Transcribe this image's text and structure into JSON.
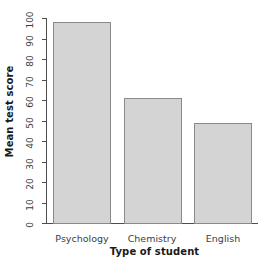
{
  "chart_data": {
    "type": "bar",
    "title": "",
    "subtitle": "",
    "xlabel": "Type of student",
    "ylabel": "Mean test score",
    "categories": [
      "Psychology",
      "Chemistry",
      "English"
    ],
    "values": [
      98,
      61,
      49
    ],
    "ylim": [
      0,
      100
    ],
    "yticks": [
      0,
      10,
      20,
      30,
      40,
      50,
      60,
      70,
      80,
      90,
      100
    ],
    "ytick_labels": [
      "0",
      "10",
      "20",
      "30",
      "40",
      "50",
      "60",
      "70",
      "80",
      "90",
      "100"
    ],
    "grid": false,
    "legend": null,
    "legend_position": "none",
    "series": [
      {
        "name": "Mean test score",
        "values": [
          98,
          61,
          49
        ]
      }
    ],
    "annotations": [],
    "colors": {
      "bar_fill": "#d4d4d4",
      "bar_border": "#8a8a8a",
      "axis": "#4d4d4d",
      "tick_label": "#3d3d3d",
      "axis_title": "#1a1a1a",
      "background": "#ffffff"
    }
  }
}
